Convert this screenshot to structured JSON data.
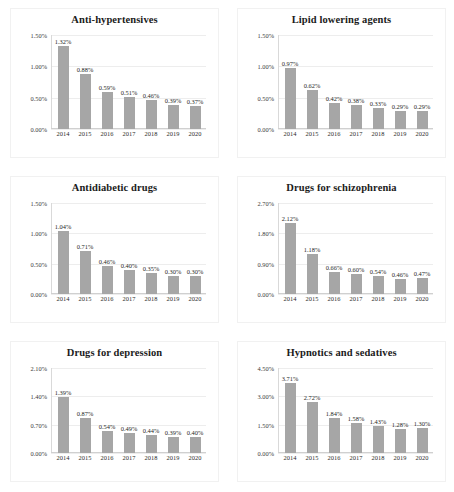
{
  "figure": {
    "bar_color": "#A6A6A6",
    "label_color": "#262626",
    "grid_color": "#EDEDED",
    "panel_count": 6
  },
  "chart_data": [
    {
      "type": "bar",
      "title": "Anti-hypertensives",
      "xlabel": "",
      "ylabel": "",
      "categories": [
        "2014",
        "2015",
        "2016",
        "2017",
        "2018",
        "2019",
        "2020"
      ],
      "values": [
        1.32,
        0.88,
        0.59,
        0.51,
        0.46,
        0.39,
        0.37
      ],
      "value_labels": [
        "1.32%",
        "0.88%",
        "0.59%",
        "0.51%",
        "0.46%",
        "0.39%",
        "0.37%"
      ],
      "yticks": [
        1.5,
        1.0,
        0.5,
        0.0
      ],
      "ytick_labels": [
        "1.50%",
        "1.00%",
        "0.50%",
        "0.00%"
      ],
      "ylim": [
        0,
        1.5
      ],
      "grid": true,
      "legend": "none"
    },
    {
      "type": "bar",
      "title": "Lipid lowering agents",
      "xlabel": "",
      "ylabel": "",
      "categories": [
        "2014",
        "2015",
        "2016",
        "2017",
        "2018",
        "2019",
        "2020"
      ],
      "values": [
        0.97,
        0.62,
        0.42,
        0.38,
        0.33,
        0.29,
        0.29
      ],
      "value_labels": [
        "0.97%",
        "0.62%",
        "0.42%",
        "0.38%",
        "0.33%",
        "0.29%",
        "0.29%"
      ],
      "yticks": [
        1.5,
        1.0,
        0.5,
        0.0
      ],
      "ytick_labels": [
        "1.50%",
        "1.00%",
        "0.50%",
        "0.00%"
      ],
      "ylim": [
        0,
        1.5
      ],
      "grid": true,
      "legend": "none"
    },
    {
      "type": "bar",
      "title": "Antidiabetic drugs",
      "xlabel": "",
      "ylabel": "",
      "categories": [
        "2014",
        "2015",
        "2016",
        "2017",
        "2018",
        "2019",
        "2020"
      ],
      "values": [
        1.04,
        0.71,
        0.46,
        0.4,
        0.35,
        0.3,
        0.3
      ],
      "value_labels": [
        "1.04%",
        "0.71%",
        "0.46%",
        "0.40%",
        "0.35%",
        "0.30%",
        "0.30%"
      ],
      "yticks": [
        1.5,
        1.0,
        0.5,
        0.0
      ],
      "ytick_labels": [
        "1.50%",
        "1.00%",
        "0.50%",
        "0.00%"
      ],
      "ylim": [
        0,
        1.5
      ],
      "grid": true,
      "legend": "none"
    },
    {
      "type": "bar",
      "title": "Drugs for schizophrenia",
      "xlabel": "",
      "ylabel": "",
      "categories": [
        "2014",
        "2015",
        "2016",
        "2017",
        "2018",
        "2019",
        "2020"
      ],
      "values": [
        2.12,
        1.18,
        0.66,
        0.6,
        0.54,
        0.46,
        0.47
      ],
      "value_labels": [
        "2.12%",
        "1.18%",
        "0.66%",
        "0.60%",
        "0.54%",
        "0.46%",
        "0.47%"
      ],
      "yticks": [
        2.7,
        1.8,
        0.9,
        0.0
      ],
      "ytick_labels": [
        "2.70%",
        "1.80%",
        "0.90%",
        "0.00%"
      ],
      "ylim": [
        0,
        2.7
      ],
      "grid": true,
      "legend": "none"
    },
    {
      "type": "bar",
      "title": "Drugs for depression",
      "xlabel": "",
      "ylabel": "",
      "categories": [
        "2014",
        "2015",
        "2016",
        "2017",
        "2018",
        "2019",
        "2020"
      ],
      "values": [
        1.39,
        0.87,
        0.54,
        0.49,
        0.44,
        0.39,
        0.4
      ],
      "value_labels": [
        "1.39%",
        "0.87%",
        "0.54%",
        "0.49%",
        "0.44%",
        "0.39%",
        "0.40%"
      ],
      "yticks": [
        2.1,
        1.4,
        0.7,
        0.0
      ],
      "ytick_labels": [
        "2.10%",
        "1.40%",
        "0.70%",
        "0.00%"
      ],
      "ylim": [
        0,
        2.1
      ],
      "grid": true,
      "legend": "none"
    },
    {
      "type": "bar",
      "title": "Hypnotics and sedatives",
      "xlabel": "",
      "ylabel": "",
      "categories": [
        "2014",
        "2015",
        "2016",
        "2017",
        "2018",
        "2019",
        "2020"
      ],
      "values": [
        3.71,
        2.72,
        1.84,
        1.58,
        1.43,
        1.28,
        1.3
      ],
      "value_labels": [
        "3.71%",
        "2.72%",
        "1.84%",
        "1.58%",
        "1.43%",
        "1.28%",
        "1.30%"
      ],
      "yticks": [
        4.5,
        3.0,
        1.5,
        0.0
      ],
      "ytick_labels": [
        "4.50%",
        "3.00%",
        "1.50%",
        "0.00%"
      ],
      "ylim": [
        0,
        4.5
      ],
      "grid": true,
      "legend": "none"
    }
  ]
}
